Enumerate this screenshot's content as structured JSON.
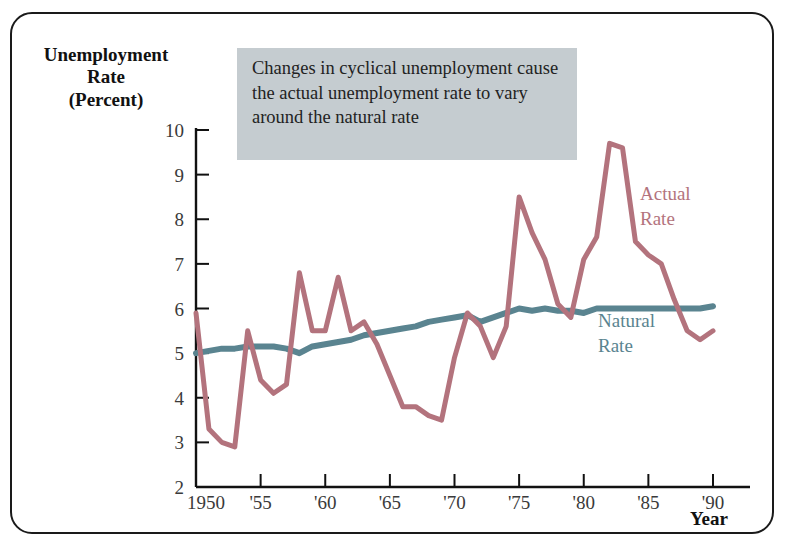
{
  "figure": {
    "y_axis_title_lines": [
      "Unemployment",
      "Rate",
      "(Percent)"
    ],
    "x_axis_title": "Year",
    "annotation": "Changes in cyclical unemployment cause the actual unemployment rate to vary around the natural rate",
    "annotation_bg": "#c5ccd0"
  },
  "labels": {
    "actual_line1": "Actual",
    "actual_line2": "Rate",
    "natural_line1": "Natural",
    "natural_line2": "Rate"
  },
  "chart_data": {
    "type": "line",
    "title": "",
    "xlabel": "Year",
    "ylabel": "Unemployment Rate (Percent)",
    "xlim": [
      1950,
      1990
    ],
    "ylim": [
      2,
      10
    ],
    "yticks": [
      2,
      3,
      4,
      5,
      6,
      7,
      8,
      9,
      10
    ],
    "xticks": [
      1950,
      1955,
      1960,
      1965,
      1970,
      1975,
      1980,
      1985,
      1990
    ],
    "xticklabels": [
      "1950",
      "'55",
      "'60",
      "'65",
      "'70",
      "'75",
      "'80",
      "'85",
      "'90"
    ],
    "grid": false,
    "legend": "inline-annotations",
    "colors": {
      "actual": "#b3737d",
      "natural": "#5a8490"
    },
    "x": [
      1950,
      1951,
      1952,
      1953,
      1954,
      1955,
      1956,
      1957,
      1958,
      1959,
      1960,
      1961,
      1962,
      1963,
      1964,
      1965,
      1966,
      1967,
      1968,
      1969,
      1970,
      1971,
      1972,
      1973,
      1974,
      1975,
      1976,
      1977,
      1978,
      1979,
      1980,
      1981,
      1982,
      1983,
      1984,
      1985,
      1986,
      1987,
      1988,
      1989,
      1990
    ],
    "series": [
      {
        "name": "Actual Rate",
        "color": "#b3737d",
        "values": [
          5.9,
          3.3,
          3.0,
          2.9,
          5.5,
          4.4,
          4.1,
          4.3,
          6.8,
          5.5,
          5.5,
          6.7,
          5.5,
          5.7,
          5.2,
          4.5,
          3.8,
          3.8,
          3.6,
          3.5,
          4.9,
          5.9,
          5.6,
          4.9,
          5.6,
          8.5,
          7.7,
          7.1,
          6.1,
          5.8,
          7.1,
          7.6,
          9.7,
          9.6,
          7.5,
          7.2,
          7.0,
          6.2,
          5.5,
          5.3,
          5.5
        ]
      },
      {
        "name": "Natural Rate",
        "color": "#5a8490",
        "values": [
          5.0,
          5.05,
          5.1,
          5.1,
          5.15,
          5.15,
          5.15,
          5.1,
          5.0,
          5.15,
          5.2,
          5.25,
          5.3,
          5.4,
          5.45,
          5.5,
          5.55,
          5.6,
          5.7,
          5.75,
          5.8,
          5.85,
          5.7,
          5.8,
          5.9,
          6.0,
          5.95,
          6.0,
          5.95,
          5.95,
          5.9,
          6.0,
          6.0,
          6.0,
          6.0,
          6.0,
          6.0,
          6.0,
          6.0,
          6.0,
          6.05
        ]
      }
    ],
    "annotations": [
      {
        "text": "Actual Rate",
        "x": 1985,
        "y": 8.6
      },
      {
        "text": "Natural Rate",
        "x": 1986,
        "y": 5.1
      }
    ]
  }
}
